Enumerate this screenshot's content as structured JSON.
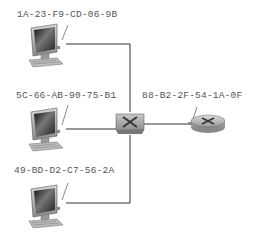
{
  "diagram": {
    "title": "",
    "nodes": [
      {
        "id": "host1",
        "type": "computer",
        "mac": "1A-23-F9-CD-06-9B"
      },
      {
        "id": "host2",
        "type": "computer",
        "mac": "5C-66-AB-90-75-B1"
      },
      {
        "id": "host3",
        "type": "computer",
        "mac": "49-BD-D2-C7-56-2A"
      },
      {
        "id": "switch",
        "type": "switch"
      },
      {
        "id": "router",
        "type": "router",
        "mac": "88-B2-2F-54-1A-0F"
      }
    ],
    "edges": [
      {
        "from": "host1",
        "to": "switch"
      },
      {
        "from": "host2",
        "to": "switch"
      },
      {
        "from": "host3",
        "to": "switch"
      },
      {
        "from": "switch",
        "to": "router"
      }
    ],
    "colors": {
      "line": "#333333",
      "device_gray": "#9a9a9a",
      "label": "#555555"
    }
  }
}
